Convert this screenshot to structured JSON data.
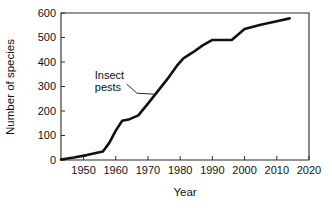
{
  "chart_data": {
    "type": "line",
    "title": "",
    "xlabel": "Year",
    "ylabel": "Number of species",
    "xlim": [
      1943,
      2020
    ],
    "ylim": [
      0,
      600
    ],
    "grid": false,
    "legend": "none",
    "xticks": [
      1950,
      1960,
      1970,
      1980,
      1990,
      2000,
      2010,
      2020
    ],
    "xtick_labels": [
      "1950",
      "1960",
      "1970",
      "1980",
      "1990",
      "2000",
      "2010",
      "2020"
    ],
    "yticks": [
      0,
      100,
      200,
      300,
      400,
      500,
      600
    ],
    "ytick_labels": [
      "0",
      "100",
      "200",
      "300",
      "400",
      "500",
      "600"
    ],
    "annotations": [
      {
        "name": "insect-pests",
        "text_lines": [
          "Insect",
          "pests"
        ],
        "text_x": 1953.5,
        "text_y": 330,
        "points_to_x": 1972.5,
        "points_to_y": 268
      }
    ],
    "series": [
      {
        "name": "Insect pests",
        "color": "#111111",
        "points": [
          [
            1943,
            2
          ],
          [
            1947,
            10
          ],
          [
            1951,
            20
          ],
          [
            1956,
            35
          ],
          [
            1958,
            70
          ],
          [
            1960,
            120
          ],
          [
            1962,
            160
          ],
          [
            1964,
            165
          ],
          [
            1967,
            182
          ],
          [
            1970,
            230
          ],
          [
            1973,
            280
          ],
          [
            1976,
            330
          ],
          [
            1979,
            385
          ],
          [
            1981,
            415
          ],
          [
            1984,
            440
          ],
          [
            1987,
            468
          ],
          [
            1990,
            490
          ],
          [
            1996,
            490
          ],
          [
            2000,
            535
          ],
          [
            2005,
            552
          ],
          [
            2010,
            566
          ],
          [
            2014,
            578
          ]
        ]
      }
    ]
  },
  "axis_labels": {
    "x_title": "Year",
    "y_title": "Number of species"
  }
}
